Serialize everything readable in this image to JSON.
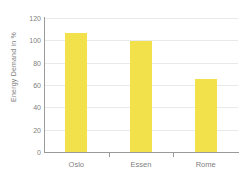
{
  "chart_data": {
    "type": "bar",
    "categories": [
      "Oslo",
      "Essen",
      "Rome"
    ],
    "values": [
      107,
      99,
      65
    ],
    "title": "",
    "xlabel": "",
    "ylabel": "Energy Demand in %",
    "ylim": [
      0,
      120
    ],
    "yticks": [
      0,
      20,
      40,
      60,
      80,
      100,
      120
    ],
    "grid": true,
    "legend": "none",
    "colors": {
      "bar": "#f2e14a",
      "axis": "#9a9a9a",
      "gridline": "#e9e9e9",
      "text": "#7f7f7f",
      "background": "#ffffff"
    }
  }
}
